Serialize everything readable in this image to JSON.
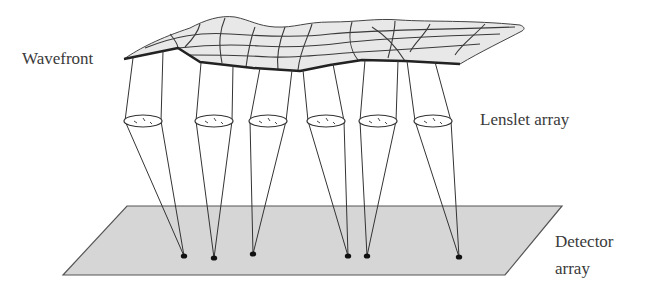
{
  "diagram": {
    "labels": {
      "wavefront": "Wavefront",
      "lenslet_array": "Lenslet array",
      "detector_line1": "Detector",
      "detector_line2": "array"
    },
    "colors": {
      "line": "#2a2a2a",
      "surface_fill": "#e6e6e6",
      "detector_fill": "#d4d4d4",
      "spot": "#111111",
      "text": "#3a3a3a"
    },
    "components": [
      {
        "id": "wavefront",
        "type": "distorted-surface-mesh"
      },
      {
        "id": "lenslet-array",
        "type": "lens-row",
        "count": 6
      },
      {
        "id": "detector-array",
        "type": "plane",
        "spots": 6
      }
    ],
    "beams": [
      {
        "index": 1,
        "lens_center_x": 143,
        "spot": [
          184,
          256
        ]
      },
      {
        "index": 2,
        "lens_center_x": 214,
        "spot": [
          214,
          258
        ]
      },
      {
        "index": 3,
        "lens_center_x": 268,
        "spot": [
          253,
          254
        ]
      },
      {
        "index": 4,
        "lens_center_x": 326,
        "spot": [
          348,
          256
        ]
      },
      {
        "index": 5,
        "lens_center_x": 378,
        "spot": [
          367,
          256
        ]
      },
      {
        "index": 6,
        "lens_center_x": 433,
        "spot": [
          459,
          257
        ]
      }
    ]
  }
}
